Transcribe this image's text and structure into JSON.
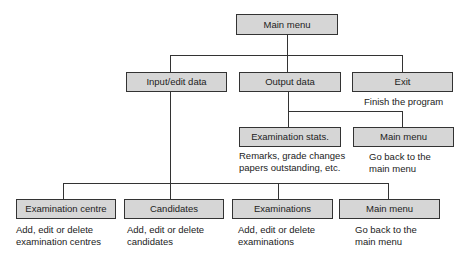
{
  "diagram": {
    "type": "menu-structure",
    "root": {
      "label": "Main menu"
    },
    "level1": [
      {
        "label": "Input/edit data"
      },
      {
        "label": "Output data"
      },
      {
        "label": "Exit",
        "description": "Finish the program"
      }
    ],
    "output_children": [
      {
        "label": "Examination stats.",
        "description_lines": [
          "Remarks, grade changes",
          "papers outstanding, etc."
        ]
      },
      {
        "label": "Main menu",
        "description_lines": [
          "Go back to the",
          "main menu"
        ]
      }
    ],
    "input_children": [
      {
        "label": "Examination centre",
        "description_lines": [
          "Add, edit or delete",
          "examination centres"
        ]
      },
      {
        "label": "Candidates",
        "description_lines": [
          "Add, edit or delete",
          "candidates"
        ]
      },
      {
        "label": "Examinations",
        "description_lines": [
          "Add, edit or delete",
          "examinations"
        ]
      },
      {
        "label": "Main menu",
        "description_lines": [
          "Go back to the",
          "main menu"
        ]
      }
    ],
    "colors": {
      "box_fill": "#d6d6d6",
      "box_border": "#333333",
      "line": "#333333"
    }
  }
}
